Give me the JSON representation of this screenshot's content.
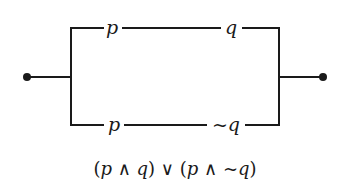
{
  "diagram": {
    "type": "switching-circuit",
    "colors": {
      "line": "#1a1a1a",
      "background": "#ffffff"
    },
    "terminals": [
      {
        "id": "left-terminal",
        "x": 27,
        "y": 77
      },
      {
        "id": "right-terminal",
        "x": 323,
        "y": 77
      }
    ],
    "branches": [
      {
        "id": "top-branch",
        "switches": [
          {
            "label": "p"
          },
          {
            "label": "q"
          }
        ]
      },
      {
        "id": "bottom-branch",
        "switches": [
          {
            "label": "p"
          },
          {
            "label": "~q"
          }
        ]
      }
    ],
    "caption": {
      "open1": "(",
      "p1": "p",
      "and1": " ∧ ",
      "q1": "q",
      "close1": ")",
      "or": " ∨ ",
      "open2": "(",
      "p2": "p",
      "and2": " ∧ ",
      "notq": "~q",
      "close2": ")"
    }
  }
}
